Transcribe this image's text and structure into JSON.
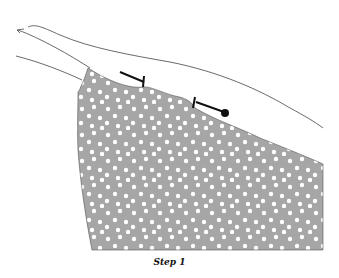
{
  "figure": {
    "caption": "Step 1",
    "fabric_color": "#a6a6a6",
    "dot_color": "#ffffff",
    "outline_color": "#333333",
    "pins": [
      {
        "name": "pin-1",
        "head": "flat"
      },
      {
        "name": "pin-2",
        "head": "round"
      }
    ]
  }
}
